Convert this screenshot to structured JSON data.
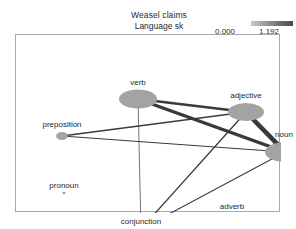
{
  "header": {
    "title": "Weasel claims",
    "language_line": "Language   sk"
  },
  "legend": {
    "min": "0,000",
    "max": "1,192",
    "gradient_from": "#c9c9c9",
    "gradient_to": "#4a4a4a"
  },
  "chart_data": {
    "type": "network",
    "title": "Weasel claims",
    "subtitle": "Language   sk",
    "legend": {
      "min": 0.0,
      "max": 1.192,
      "position": "top-right"
    },
    "grid": false,
    "node_color": "#a3a3a3",
    "edge_color": "#3a3a3a",
    "nodes": [
      {
        "id": "verb",
        "label": "verb",
        "x": 122,
        "y": 64,
        "rx": 19,
        "ry": 9.5,
        "weight": 0.85,
        "label_dx": 0,
        "label_dy": -17
      },
      {
        "id": "adjective",
        "label": "adjective",
        "x": 230,
        "y": 77,
        "rx": 18,
        "ry": 9,
        "weight": 0.9,
        "label_dx": 0,
        "label_dy": -17
      },
      {
        "id": "noun",
        "label": "noun",
        "x": 269,
        "y": 117,
        "rx": 20,
        "ry": 10,
        "weight": 1.0,
        "label_dx": -1,
        "label_dy": -18
      },
      {
        "id": "preposition",
        "label": "preposition",
        "x": 46,
        "y": 101,
        "rx": 6,
        "ry": 4,
        "weight": 0.3,
        "label_dx": 0,
        "label_dy": -12
      },
      {
        "id": "pronoun",
        "label": "pronoun",
        "x": 48,
        "y": 158,
        "rx": 1.6,
        "ry": 1.2,
        "weight": 0.05,
        "label_dx": 0,
        "label_dy": -8
      },
      {
        "id": "conjunction",
        "label": "conjunction",
        "x": 125,
        "y": 194,
        "rx": 2,
        "ry": 1.6,
        "weight": 0.08,
        "label_dx": 0,
        "label_dy": -8
      },
      {
        "id": "adverb",
        "label": "adverb",
        "x": 216,
        "y": 179,
        "rx": 1.4,
        "ry": 1.1,
        "weight": 0.04,
        "label_dx": 0,
        "label_dy": -8
      }
    ],
    "edges": [
      {
        "source": "verb",
        "target": "adjective",
        "width": 2.6,
        "value": 0.86
      },
      {
        "source": "verb",
        "target": "noun",
        "width": 3.4,
        "value": 1.1
      },
      {
        "source": "verb",
        "target": "conjunction",
        "width": 0.7,
        "value": 0.22
      },
      {
        "source": "adjective",
        "target": "noun",
        "width": 4.6,
        "value": 1.192
      },
      {
        "source": "adjective",
        "target": "preposition",
        "width": 1.5,
        "value": 0.55
      },
      {
        "source": "adjective",
        "target": "conjunction",
        "width": 1.3,
        "value": 0.48
      },
      {
        "source": "noun",
        "target": "preposition",
        "width": 1.1,
        "value": 0.4
      },
      {
        "source": "noun",
        "target": "conjunction",
        "width": 1.1,
        "value": 0.42
      }
    ]
  }
}
